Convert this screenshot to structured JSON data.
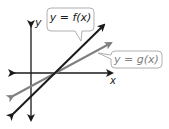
{
  "diagram": {
    "axes": {
      "x_label": "x",
      "y_label": "y"
    },
    "lines": [
      {
        "name": "f",
        "label": "y = f(x)",
        "color": "#1a1a1a"
      },
      {
        "name": "g",
        "label": "y = g(x)",
        "color": "#808080"
      }
    ],
    "callout_border_color": "#b0b0b0"
  }
}
